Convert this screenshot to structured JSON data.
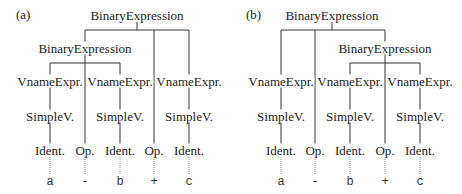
{
  "panels": [
    {
      "label": "(a)",
      "root": "BinaryExpression",
      "inner": "BinaryExpression",
      "vname": [
        "VnameExpr.",
        "VnameExpr.",
        "VnameExpr."
      ],
      "simple": [
        "SimpleV.",
        "SimpleV.",
        "SimpleV."
      ],
      "leaves": [
        "Ident.",
        "Op.",
        "Ident.",
        "Op.",
        "Ident."
      ],
      "tokens": [
        "a",
        "-",
        "b",
        "+",
        "c"
      ]
    },
    {
      "label": "(b)",
      "root": "BinaryExpression",
      "inner": "BinaryExpression",
      "vname": [
        "VnameExpr.",
        "VnameExpr.",
        "VnameExpr."
      ],
      "simple": [
        "SimpleV.",
        "SimpleV.",
        "SimpleV."
      ],
      "leaves": [
        "Ident.",
        "Op.",
        "Ident.",
        "Op.",
        "Ident."
      ],
      "tokens": [
        "a",
        "-",
        "b",
        "+",
        "c"
      ]
    }
  ],
  "colors": {
    "line": "#333333",
    "text": "#222222",
    "dotted": "#888888"
  }
}
